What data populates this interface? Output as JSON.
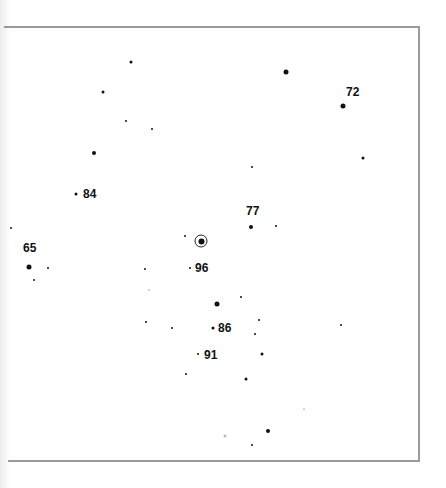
{
  "chart": {
    "type": "finder-chart",
    "frame": {
      "top": 27,
      "bottom": 461,
      "right": 419,
      "border_color": "#9a9a9a"
    },
    "target": {
      "name": "target-variable-star",
      "x": 201,
      "y": 241
    },
    "labeled_stars": [
      {
        "label": "72",
        "x": 343,
        "y": 106,
        "size": 5,
        "label_x": 346,
        "label_y": 92
      },
      {
        "label": "84",
        "x": 76,
        "y": 194,
        "size": 3,
        "label_x": 83,
        "label_y": 194
      },
      {
        "label": "77",
        "x": 251,
        "y": 227,
        "size": 4,
        "label_x": 246,
        "label_y": 211
      },
      {
        "label": "65",
        "x": 29,
        "y": 267,
        "size": 5,
        "label_x": 23,
        "label_y": 248
      },
      {
        "label": "96",
        "x": 190,
        "y": 268,
        "size": 2,
        "label_x": 195,
        "label_y": 268
      },
      {
        "label": "86",
        "x": 213,
        "y": 328,
        "size": 3,
        "label_x": 218,
        "label_y": 328
      },
      {
        "label": "91",
        "x": 198,
        "y": 354,
        "size": 2,
        "label_x": 204,
        "label_y": 355
      }
    ],
    "stars": [
      {
        "x": 131,
        "y": 62,
        "size": 3
      },
      {
        "x": 286,
        "y": 72,
        "size": 5
      },
      {
        "x": 103,
        "y": 92,
        "size": 3
      },
      {
        "x": 126,
        "y": 121,
        "size": 2
      },
      {
        "x": 152,
        "y": 129,
        "size": 2
      },
      {
        "x": 94,
        "y": 153,
        "size": 4
      },
      {
        "x": 252,
        "y": 167,
        "size": 2
      },
      {
        "x": 363,
        "y": 158,
        "size": 3
      },
      {
        "x": 276,
        "y": 226,
        "size": 2
      },
      {
        "x": 185,
        "y": 236,
        "size": 2
      },
      {
        "x": 11,
        "y": 228,
        "size": 2
      },
      {
        "x": 48,
        "y": 268,
        "size": 2
      },
      {
        "x": 34,
        "y": 280,
        "size": 2
      },
      {
        "x": 145,
        "y": 269,
        "size": 2
      },
      {
        "x": 149,
        "y": 290,
        "size": 1
      },
      {
        "x": 217,
        "y": 304,
        "size": 5
      },
      {
        "x": 241,
        "y": 297,
        "size": 2
      },
      {
        "x": 146,
        "y": 322,
        "size": 2
      },
      {
        "x": 172,
        "y": 328,
        "size": 2
      },
      {
        "x": 259,
        "y": 320,
        "size": 2
      },
      {
        "x": 255,
        "y": 334,
        "size": 2
      },
      {
        "x": 341,
        "y": 325,
        "size": 2
      },
      {
        "x": 262,
        "y": 354,
        "size": 3
      },
      {
        "x": 186,
        "y": 374,
        "size": 2
      },
      {
        "x": 246,
        "y": 379,
        "size": 3
      },
      {
        "x": 304,
        "y": 409,
        "size": 1
      },
      {
        "x": 268,
        "y": 431,
        "size": 4
      },
      {
        "x": 252,
        "y": 445,
        "size": 2
      },
      {
        "x": 225,
        "y": 436,
        "size": 3,
        "faint": true
      }
    ]
  }
}
